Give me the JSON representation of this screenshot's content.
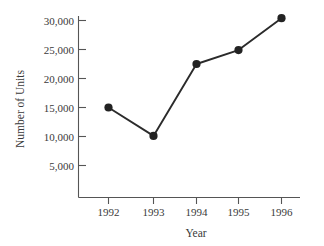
{
  "chart_data": {
    "type": "line",
    "title": "",
    "subtitle": "",
    "xlabel": "Year",
    "ylabel": "Number of Units",
    "categories": [
      "1992",
      "1993",
      "1994",
      "1995",
      "1996"
    ],
    "x": [
      1992,
      1993,
      1994,
      1995,
      1996
    ],
    "values": [
      15000,
      10100,
      22500,
      24900,
      30400
    ],
    "series": [
      {
        "name": "Number of Units",
        "values": [
          15000,
          10100,
          22500,
          24900,
          30400
        ]
      }
    ],
    "ytick_labels": [
      "5,000",
      "10,000",
      "15,000",
      "20,000",
      "25,000",
      "30,000"
    ],
    "ytick_values": [
      5000,
      10000,
      15000,
      20000,
      25000,
      30000
    ],
    "xtick_labels": [
      "1992",
      "1993",
      "1994",
      "1995",
      "1996"
    ],
    "ylim": [
      0,
      32000
    ],
    "xlim": [
      1991.6,
      1996.6
    ],
    "grid": false,
    "legend": false,
    "legend_position": "none",
    "marker": "filled-circle",
    "line_color": "#2b2b2b",
    "marker_color": "#232323",
    "axis_color": "#555555",
    "text_color": "#3a3a3a",
    "background": "#ffffff",
    "annotations": []
  }
}
